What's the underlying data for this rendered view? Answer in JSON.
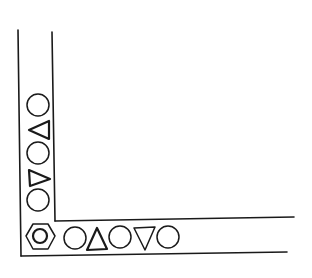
{
  "diagram": {
    "type": "L-shaped channel line drawing",
    "colors": {
      "stroke": "#1a1a1a",
      "background": "#ffffff"
    },
    "channel": {
      "outer_left_line": {
        "x1": 18,
        "y1": 30,
        "x2": 21,
        "y2": 256
      },
      "inner_left_line": {
        "x1": 52,
        "y1": 32,
        "x2": 55,
        "y2": 221
      },
      "inner_bottom_line": {
        "x1": 55,
        "y1": 221,
        "x2": 294,
        "y2": 217
      },
      "outer_bottom_line": {
        "x1": 21,
        "y1": 256,
        "x2": 287,
        "y2": 252
      }
    },
    "vertical_sequence": [
      {
        "shape": "circle",
        "cx": 38,
        "cy": 105,
        "r": 11
      },
      {
        "shape": "triangle-left",
        "cx": 40,
        "cy": 130
      },
      {
        "shape": "circle",
        "cx": 38,
        "cy": 153,
        "r": 11
      },
      {
        "shape": "triangle-right",
        "cx": 38,
        "cy": 177
      },
      {
        "shape": "circle",
        "cx": 38,
        "cy": 200,
        "r": 11
      }
    ],
    "corner_shape": {
      "shape": "hexagon-with-inner-circle",
      "cx": 40,
      "cy": 237
    },
    "horizontal_sequence": [
      {
        "shape": "circle",
        "cx": 75,
        "cy": 238,
        "r": 11
      },
      {
        "shape": "triangle-up",
        "cx": 97,
        "cy": 240
      },
      {
        "shape": "circle",
        "cx": 120,
        "cy": 237,
        "r": 11
      },
      {
        "shape": "triangle-down",
        "cx": 145,
        "cy": 238
      },
      {
        "shape": "circle",
        "cx": 168,
        "cy": 237,
        "r": 11
      }
    ]
  }
}
